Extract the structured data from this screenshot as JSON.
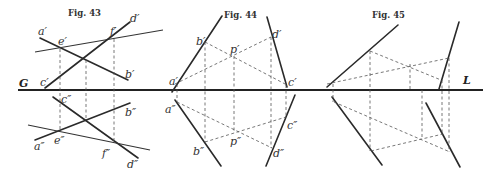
{
  "ground_line": {
    "left_label": "G",
    "right_label": "L"
  },
  "fig43": {
    "title": "Fig. 43",
    "labels": {
      "a1": "a′",
      "e1": "e′",
      "f1": "f′",
      "d1": "d′",
      "b1": "b′",
      "c1": "c′",
      "c2": "c″",
      "b2": "b″",
      "a2": "a″",
      "e2": "e″",
      "f2": "f″",
      "d2": "d″"
    }
  },
  "fig44": {
    "title": "Fig. 44",
    "labels": {
      "b1": "b′",
      "p1": "p′",
      "d1": "d′",
      "a1": "a′",
      "c1": "c′",
      "a2": "a″",
      "c2": "c″",
      "p2": "p″",
      "b2": "b″",
      "d2": "d″"
    }
  },
  "fig45": {
    "title": "Fig. 45"
  }
}
